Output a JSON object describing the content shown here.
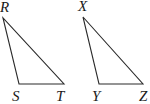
{
  "diagram": {
    "type": "two-triangles",
    "triangles": [
      {
        "name": "RST",
        "vertices": [
          {
            "label": "R",
            "x": 3,
            "y": 18,
            "lx": 0,
            "ly": 12
          },
          {
            "label": "S",
            "x": 19,
            "y": 84,
            "lx": 12,
            "ly": 101
          },
          {
            "label": "T",
            "x": 64,
            "y": 84,
            "lx": 56,
            "ly": 101
          }
        ]
      },
      {
        "name": "XYZ",
        "vertices": [
          {
            "label": "X",
            "x": 83,
            "y": 17,
            "lx": 78,
            "ly": 11
          },
          {
            "label": "Y",
            "x": 99,
            "y": 84,
            "lx": 92,
            "ly": 101
          },
          {
            "label": "Z",
            "x": 143,
            "y": 84,
            "lx": 139,
            "ly": 101
          }
        ]
      }
    ],
    "stroke_color": "#2a2a2a",
    "label_color": "#1a1a1a"
  }
}
